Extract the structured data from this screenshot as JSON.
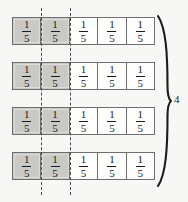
{
  "figure": {
    "type": "fraction-bar-model",
    "background_color": "#f7f7f5",
    "line_color": "#6e6e6e",
    "shade_color": "#c9c9c6",
    "text_color": "#1c1c1c",
    "guide_line_color": "#4a4a4a"
  },
  "fraction": {
    "numerator": "1",
    "denominator": "5"
  },
  "rows": [
    {
      "id": "row-1",
      "cells": [
        {
          "numerator": "1",
          "denominator": "5",
          "shaded": true
        },
        {
          "numerator": "1",
          "denominator": "5",
          "shaded": true
        },
        {
          "numerator": "1",
          "denominator": "5",
          "shaded": false
        },
        {
          "numerator": "1",
          "denominator": "5",
          "shaded": false
        },
        {
          "numerator": "1",
          "denominator": "5",
          "shaded": false
        }
      ]
    },
    {
      "id": "row-2",
      "cells": [
        {
          "numerator": "1",
          "denominator": "5",
          "shaded": true
        },
        {
          "numerator": "1",
          "denominator": "5",
          "shaded": true
        },
        {
          "numerator": "1",
          "denominator": "5",
          "shaded": false
        },
        {
          "numerator": "1",
          "denominator": "5",
          "shaded": false
        },
        {
          "numerator": "1",
          "denominator": "5",
          "shaded": false
        }
      ]
    },
    {
      "id": "row-3",
      "cells": [
        {
          "numerator": "1",
          "denominator": "5",
          "shaded": true
        },
        {
          "numerator": "1",
          "denominator": "5",
          "shaded": true
        },
        {
          "numerator": "1",
          "denominator": "5",
          "shaded": false
        },
        {
          "numerator": "1",
          "denominator": "5",
          "shaded": false
        },
        {
          "numerator": "1",
          "denominator": "5",
          "shaded": false
        }
      ]
    },
    {
      "id": "row-4",
      "cells": [
        {
          "numerator": "1",
          "denominator": "5",
          "shaded": true
        },
        {
          "numerator": "1",
          "denominator": "5",
          "shaded": true
        },
        {
          "numerator": "1",
          "denominator": "5",
          "shaded": false
        },
        {
          "numerator": "1",
          "denominator": "5",
          "shaded": false
        },
        {
          "numerator": "1",
          "denominator": "5",
          "shaded": false
        }
      ]
    }
  ],
  "guides": [
    {
      "id": "guide-left",
      "after_cell": 1
    },
    {
      "id": "guide-right",
      "after_cell": 2
    }
  ],
  "brace": {
    "orientation": "right",
    "label": "4"
  }
}
